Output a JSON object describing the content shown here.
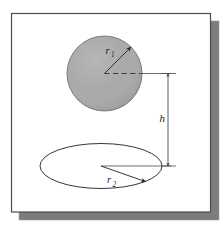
{
  "figure": {
    "kind": "geometry-diagram",
    "frame": {
      "border_color": "#4d4d4d",
      "fill_color": "#ffffff",
      "shadow_color": "#7a7a7a",
      "top_edge_tint_left": "#8a8ad0",
      "top_edge_tint_right": "#e6e0a0"
    },
    "sphere": {
      "name": "sphere",
      "fill_color": "#a9a9a9",
      "stroke_color": "#6e6e6e",
      "center_x": 104.5,
      "center_y": 73.5,
      "radius": 37.5
    },
    "disk": {
      "name": "ellipse-disk",
      "stroke_color": "#2b2b2b",
      "center_x": 101,
      "center_y": 166,
      "radius_x": 61,
      "radius_y": 22.5
    },
    "dimension_line": {
      "name": "height-dimension",
      "x": 168,
      "y_top": 73,
      "y_bottom": 167,
      "stroke_color": "#5a5a5a"
    },
    "labels": {
      "sphere_radius": {
        "symbol": "r",
        "subscript": "1"
      },
      "disk_radius": {
        "symbol": "r",
        "subscript": "2"
      },
      "height": {
        "symbol": "h",
        "subscript": ""
      }
    },
    "leaders": {
      "sphere_radius_line": {
        "x1": 104.5,
        "y1": 73.5,
        "x2": 131,
        "y2": 47
      },
      "disk_radius_line": {
        "x1": 101,
        "y1": 166,
        "x2": 146,
        "y2": 182
      },
      "center_dashed_line": {
        "x1": 104.5,
        "y1": 73.5,
        "x2": 142,
        "y2": 73.5
      },
      "center_solid_extension": {
        "x1": 142,
        "y1": 73.5,
        "x2": 171,
        "y2": 73.5
      },
      "disk_solid_extension": {
        "x1": 101,
        "y1": 166,
        "x2": 171,
        "y2": 166
      }
    }
  }
}
